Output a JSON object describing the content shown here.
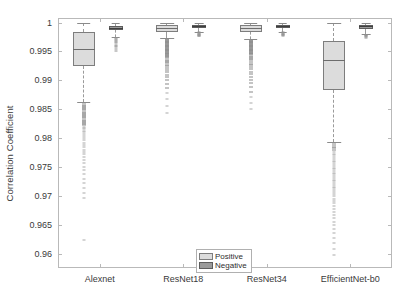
{
  "chart_data": {
    "type": "box",
    "title": "",
    "xlabel": "",
    "ylabel": "Correlation Coefficient",
    "ylim": [
      0.9575,
      1.0008
    ],
    "yticks": [
      1,
      0.995,
      0.99,
      0.985,
      0.98,
      0.975,
      0.97,
      0.965,
      0.96
    ],
    "ytick_labels": [
      "1",
      "0.995",
      "0.99",
      "0.985",
      "0.98",
      "0.975",
      "0.97",
      "0.965",
      "0.96"
    ],
    "categories": [
      "Alexnet",
      "ResNet18",
      "ResNet34",
      "EfficientNet-b0"
    ],
    "grid": false,
    "legend": {
      "position": "bottom-center",
      "entries": [
        {
          "label": "Positive",
          "color": "#dcdcdc"
        },
        {
          "label": "Negative",
          "color": "#9a9a9a"
        }
      ]
    },
    "series": [
      {
        "name": "Positive",
        "color": "#dcdcdc",
        "boxes": [
          {
            "category": "Alexnet",
            "q1": 0.9925,
            "median": 0.99545,
            "q3": 0.99845,
            "whisker_low": 0.98625,
            "whisker_high": 0.99995
          },
          {
            "category": "ResNet18",
            "q1": 0.99845,
            "median": 0.99915,
            "q3": 0.99955,
            "whisker_low": 0.99735,
            "whisker_high": 0.99995
          },
          {
            "category": "ResNet34",
            "q1": 0.99835,
            "median": 0.99905,
            "q3": 0.99955,
            "whisker_low": 0.99715,
            "whisker_high": 0.99995
          },
          {
            "category": "EfficientNet-b0",
            "q1": 0.98825,
            "median": 0.99345,
            "q3": 0.99685,
            "whisker_low": 0.97935,
            "whisker_high": 0.99995
          }
        ]
      },
      {
        "name": "Negative",
        "color": "#9a9a9a",
        "boxes": [
          {
            "category": "Alexnet",
            "q1": 0.99865,
            "median": 0.99905,
            "q3": 0.99945,
            "whisker_low": 0.99755,
            "whisker_high": 0.99995
          },
          {
            "category": "ResNet18",
            "q1": 0.99915,
            "median": 0.99945,
            "q3": 0.99965,
            "whisker_low": 0.99845,
            "whisker_high": 0.99995
          },
          {
            "category": "ResNet34",
            "q1": 0.99915,
            "median": 0.99945,
            "q3": 0.99965,
            "whisker_low": 0.99845,
            "whisker_high": 0.99995
          },
          {
            "category": "EfficientNet-b0",
            "q1": 0.99895,
            "median": 0.99935,
            "q3": 0.99965,
            "whisker_low": 0.99805,
            "whisker_high": 0.99995
          }
        ]
      }
    ],
    "outliers": {
      "Alexnet_Positive": [
        0.986,
        0.9858,
        0.9856,
        0.9854,
        0.9852,
        0.985,
        0.9848,
        0.9846,
        0.9844,
        0.9842,
        0.984,
        0.9838,
        0.9836,
        0.9834,
        0.9832,
        0.983,
        0.9828,
        0.9826,
        0.9824,
        0.9822,
        0.982,
        0.9818,
        0.9816,
        0.9813,
        0.981,
        0.9807,
        0.9804,
        0.98,
        0.9796,
        0.9792,
        0.9788,
        0.9784,
        0.978,
        0.9776,
        0.9772,
        0.9768,
        0.9762,
        0.9756,
        0.975,
        0.9744,
        0.9737,
        0.973,
        0.9722,
        0.9714,
        0.9705,
        0.9696,
        0.9624
      ],
      "Alexnet_Negative": [
        0.9974,
        0.9972,
        0.997,
        0.9968,
        0.9966,
        0.9964,
        0.9962,
        0.996,
        0.9957,
        0.9954,
        0.9951
      ],
      "ResNet18_Positive": [
        0.9972,
        0.9971,
        0.997,
        0.9969,
        0.9968,
        0.9967,
        0.9966,
        0.9965,
        0.9964,
        0.9963,
        0.9962,
        0.9961,
        0.996,
        0.9959,
        0.9958,
        0.9957,
        0.9956,
        0.9955,
        0.9954,
        0.9953,
        0.9952,
        0.9951,
        0.995,
        0.9949,
        0.9948,
        0.9947,
        0.9946,
        0.9945,
        0.9944,
        0.9943,
        0.9942,
        0.994,
        0.9938,
        0.9936,
        0.9934,
        0.9932,
        0.993,
        0.9927,
        0.9924,
        0.9921,
        0.9918,
        0.9914,
        0.991,
        0.9906,
        0.99,
        0.9894,
        0.9886,
        0.9878,
        0.9868,
        0.9856,
        0.9843
      ],
      "ResNet18_Negative": [
        0.9983,
        0.9982,
        0.9981,
        0.998,
        0.9979,
        0.9978,
        0.9977,
        0.9976
      ],
      "ResNet34_Positive": [
        0.997,
        0.9969,
        0.9968,
        0.9967,
        0.9966,
        0.9965,
        0.9964,
        0.9963,
        0.9962,
        0.9961,
        0.996,
        0.9959,
        0.9958,
        0.9957,
        0.9956,
        0.9955,
        0.9954,
        0.9953,
        0.9952,
        0.9951,
        0.995,
        0.9949,
        0.9948,
        0.9947,
        0.9946,
        0.9945,
        0.9943,
        0.9941,
        0.9939,
        0.9937,
        0.9935,
        0.9932,
        0.9929,
        0.9926,
        0.9923,
        0.9919,
        0.9915,
        0.9911,
        0.9906,
        0.9901,
        0.9895,
        0.9888,
        0.988,
        0.9871,
        0.9861,
        0.985
      ],
      "ResNet34_Negative": [
        0.9983,
        0.9982,
        0.9981,
        0.998,
        0.9979,
        0.9978,
        0.9977
      ],
      "EfficientNet-b0_Positive": [
        0.9791,
        0.9788,
        0.9785,
        0.9782,
        0.9779,
        0.9776,
        0.9773,
        0.977,
        0.9767,
        0.9764,
        0.9761,
        0.9758,
        0.9755,
        0.9752,
        0.9749,
        0.9746,
        0.9743,
        0.974,
        0.9737,
        0.9734,
        0.9731,
        0.9728,
        0.9725,
        0.9722,
        0.9719,
        0.9716,
        0.9713,
        0.971,
        0.9707,
        0.9703,
        0.9699,
        0.9695,
        0.9691,
        0.9687,
        0.9682,
        0.9677,
        0.9672,
        0.9667,
        0.9661,
        0.9655,
        0.9649,
        0.9642,
        0.9635,
        0.9627,
        0.9618,
        0.9608,
        0.9598
      ],
      "EfficientNet-b0_Negative": [
        0.9979,
        0.9978,
        0.9977,
        0.9976,
        0.9975,
        0.9974
      ]
    }
  }
}
